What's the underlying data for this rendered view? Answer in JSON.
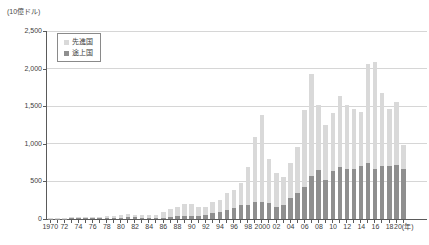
{
  "colors": {
    "developed_bar": "#d9d9d9",
    "developing_bar": "#8f8f8f",
    "axis": "#5a5a5a",
    "gridline": "#d6d6d6",
    "text": "#3d3d3d",
    "legend_border": "#8a8a8a",
    "background": "#ffffff"
  },
  "chart_data": {
    "type": "bar",
    "stacked": true,
    "title": "",
    "unit": "(10億ドル)",
    "xlabel": "(年)",
    "ylabel": "",
    "ylim": [
      0,
      2500
    ],
    "ytick_interval": 500,
    "ytick_labels": [
      "0",
      "500",
      "1,000",
      "1,500",
      "2,000",
      "2,500"
    ],
    "grid": true,
    "legend_position": "top-left",
    "years": [
      1970,
      1971,
      1972,
      1973,
      1974,
      1975,
      1976,
      1977,
      1978,
      1979,
      1980,
      1981,
      1982,
      1983,
      1984,
      1985,
      1986,
      1987,
      1988,
      1989,
      1990,
      1991,
      1992,
      1993,
      1994,
      1995,
      1996,
      1997,
      1998,
      1999,
      2000,
      2001,
      2002,
      2003,
      2004,
      2005,
      2006,
      2007,
      2008,
      2009,
      2010,
      2011,
      2012,
      2013,
      2014,
      2015,
      2016,
      2017,
      2018,
      2019,
      2020
    ],
    "xtick_labels": [
      "1970",
      "72",
      "74",
      "76",
      "78",
      "80",
      "82",
      "84",
      "86",
      "88",
      "90",
      "92",
      "94",
      "96",
      "98",
      "2000",
      "02",
      "04",
      "06",
      "08",
      "10",
      "12",
      "14",
      "16",
      "18",
      "20(年)"
    ],
    "series": [
      {
        "name": "先進国",
        "role": "top-segment",
        "color": "#d9d9d9",
        "values": [
          9,
          10,
          12,
          14,
          17,
          17,
          14,
          17,
          22,
          28,
          39,
          45,
          31,
          31,
          38,
          41,
          71,
          111,
          130,
          162,
          170,
          113,
          114,
          149,
          163,
          224,
          246,
          288,
          500,
          858,
          1148,
          585,
          444,
          380,
          475,
          619,
          1023,
          1356,
          870,
          731,
          773,
          954,
          848,
          789,
          721,
          1316,
          1420,
          969,
          761,
          827,
          315
        ]
      },
      {
        "name": "途上国",
        "role": "bottom-segment",
        "color": "#8f8f8f",
        "values": [
          4,
          4,
          5,
          7,
          9,
          10,
          8,
          10,
          12,
          14,
          15,
          25,
          27,
          19,
          19,
          15,
          16,
          25,
          34,
          36,
          35,
          41,
          52,
          74,
          93,
          117,
          146,
          193,
          190,
          232,
          232,
          215,
          166,
          180,
          275,
          341,
          427,
          574,
          650,
          519,
          637,
          686,
          662,
          671,
          699,
          744,
          670,
          701,
          699,
          723,
          665
        ]
      }
    ]
  }
}
